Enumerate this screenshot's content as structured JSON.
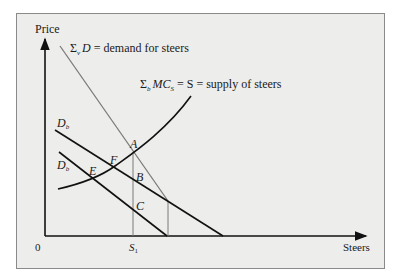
{
  "diagram": {
    "axes": {
      "y_label": "Price",
      "x_label": "Steers",
      "origin_label": "0",
      "x_tick_label": {
        "main": "S",
        "sub": "1"
      }
    },
    "curves": {
      "demand": {
        "sigma_sub": "v",
        "symbol": "D",
        "rest": " = demand for steers",
        "color": "#7a7a7a"
      },
      "supply": {
        "sigma_sub": "b",
        "symbol": "MC",
        "symbol_sub": "S",
        "rest": " = S = supply of steers",
        "color": "#111111"
      },
      "individual_demand_upper": {
        "symbol": "D",
        "sub": "b"
      },
      "individual_demand_lower": {
        "symbol": "D",
        "sub": "b"
      }
    },
    "points": {
      "A": "A",
      "B": "B",
      "C": "C",
      "E": "E",
      "F": "F"
    },
    "colors": {
      "background": "#ededeb",
      "frame": "#8a8a8a",
      "axis": "#111111",
      "guide": "#7a7a7a"
    }
  }
}
